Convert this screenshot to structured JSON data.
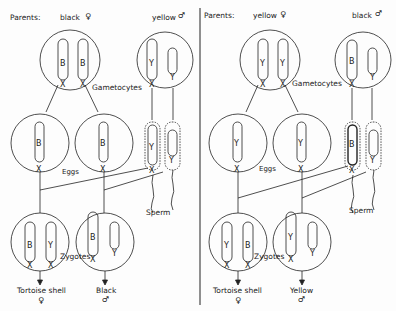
{
  "diagram": {
    "panels": [
      {
        "id": "left",
        "parents_label": "Parents:",
        "female_parent": {
          "label": "black",
          "symbol": "♀",
          "chromosomes": [
            "B",
            "B"
          ]
        },
        "male_parent": {
          "label": "yellow",
          "symbol": "♂",
          "chromosomes": [
            "Y",
            "Y-short"
          ]
        },
        "gametocytes_label": "Gametocytes",
        "eggs_label": "Eggs",
        "sperm_label": "Sperm",
        "zygotes_label": "Zygotes",
        "eggs": [
          {
            "chromosome": "B"
          },
          {
            "chromosome": "B"
          }
        ],
        "sperm": [
          {
            "chromosome": "Y"
          },
          {
            "chromosome": "Y-short"
          }
        ],
        "zygotes": [
          {
            "chromosomes": [
              "B",
              "Y"
            ],
            "outcome": "Tortoise shell",
            "symbol": "♀"
          },
          {
            "chromosomes": [
              "B",
              "Y-short"
            ],
            "outcome": "Black",
            "symbol": "♂"
          }
        ]
      },
      {
        "id": "right",
        "parents_label": "Parents:",
        "female_parent": {
          "label": "yellow",
          "symbol": "♀",
          "chromosomes": [
            "Y",
            "Y"
          ]
        },
        "male_parent": {
          "label": "black",
          "symbol": "♂",
          "chromosomes": [
            "B",
            "Y-short"
          ]
        },
        "gametocytes_label": "Gametocytes",
        "eggs_label": "Eggs",
        "sperm_label": "Sperm",
        "zygotes_label": "Zygotes",
        "eggs": [
          {
            "chromosome": "Y"
          },
          {
            "chromosome": "Y"
          }
        ],
        "sperm": [
          {
            "chromosome": "B"
          },
          {
            "chromosome": "Y-short"
          }
        ],
        "zygotes": [
          {
            "chromosomes": [
              "Y",
              "B"
            ],
            "outcome": "Tortoise shell",
            "symbol": "♀"
          },
          {
            "chromosomes": [
              "Y",
              "Y-short"
            ],
            "outcome": "Yellow",
            "symbol": "♂"
          }
        ]
      }
    ],
    "glyphs": {
      "B": "B",
      "Y": "Y",
      "X": "X"
    },
    "colors": {
      "ink": "#222222",
      "background": "#fdfdfd"
    }
  }
}
